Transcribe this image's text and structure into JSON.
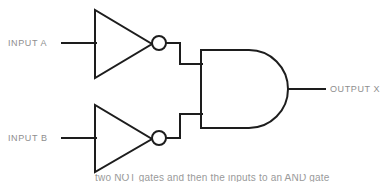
{
  "diagram": {
    "type": "logic-circuit",
    "background_color": "#ffffff",
    "line_color": "#1d1d1d",
    "label_color": "#8e8e8e",
    "labels": {
      "input_a": "INPUT A",
      "input_b": "INPUT B",
      "output_x": "OUTPUT X"
    },
    "caption": {
      "text": "two NOT gates and then the inputs to an AND gate",
      "clipped": true
    },
    "gates": [
      {
        "id": "not-gate-a",
        "name": "NOT gate (inverter) on INPUT A",
        "kind": "NOT",
        "bubble": true
      },
      {
        "id": "not-gate-b",
        "name": "NOT gate (inverter) on INPUT B",
        "kind": "NOT",
        "bubble": true
      },
      {
        "id": "and-gate",
        "name": "AND gate",
        "kind": "AND",
        "bubble": false
      }
    ],
    "nets": [
      {
        "id": "net-input-a",
        "from": "INPUT A",
        "to": "not-gate-a"
      },
      {
        "id": "net-input-b",
        "from": "INPUT B",
        "to": "not-gate-b"
      },
      {
        "id": "net-nota-and",
        "from": "not-gate-a",
        "to": "and-gate"
      },
      {
        "id": "net-notb-and",
        "from": "not-gate-b",
        "to": "and-gate"
      },
      {
        "id": "net-output-x",
        "from": "and-gate",
        "to": "OUTPUT X"
      }
    ]
  }
}
